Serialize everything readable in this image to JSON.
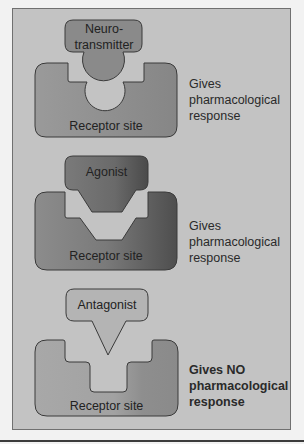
{
  "diagram": {
    "panels": [
      {
        "ligand_label": "Neuro-\ntransmitter",
        "ligand_line1": "Neuro-",
        "ligand_line2": "transmitter",
        "receptor_label": "Receptor site",
        "response": "Gives\npharmacological\nresponse",
        "response_bold": false
      },
      {
        "ligand_label": "Agonist",
        "receptor_label": "Receptor site",
        "response": "Gives\npharmacological\nresponse",
        "response_bold": false
      },
      {
        "ligand_label": "Antagonist",
        "receptor_label": "Receptor site",
        "response": "Gives NO\npharmacological\nresponse",
        "response_bold": true
      }
    ],
    "colors": {
      "background": "#c3c3c3",
      "neurotransmitter": "#8a8a8a",
      "receptor1": "#8e8e8e",
      "agonist": "#6e6e6e",
      "receptor2": "#6c6c6c",
      "antagonist": "#b2b2b2",
      "receptor3": "#a0a0a0"
    }
  }
}
